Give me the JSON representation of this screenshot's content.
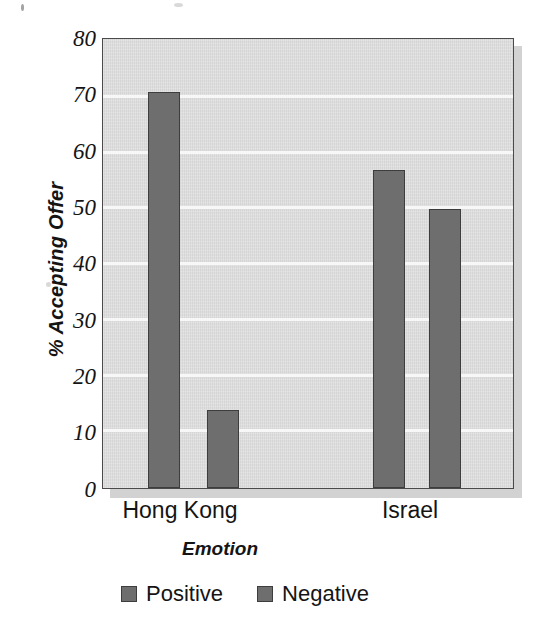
{
  "chart_data": {
    "type": "bar",
    "title": "",
    "xlabel": "Emotion",
    "ylabel": "% Accepting Offer",
    "categories": [
      "Hong Kong",
      "Israel"
    ],
    "series": [
      {
        "name": "Positive",
        "values": [
          71,
          57
        ]
      },
      {
        "name": "Negative",
        "values": [
          14,
          50
        ]
      }
    ],
    "ylim": [
      0,
      80
    ],
    "yticks": [
      80,
      70,
      60,
      50,
      40,
      30,
      20,
      10,
      0
    ],
    "ytick_labels": [
      "80",
      "70",
      "60",
      "50",
      "40",
      "30",
      "20",
      "10",
      "0"
    ],
    "grid": "horizontal",
    "legend_position": "bottom-center",
    "colors": {
      "positive_bar": "#6e6e6e",
      "negative_bar": "#6e6e6e",
      "bar_outline": "#3d3d3d",
      "plot_background": "#dcdcdc",
      "gridline": "#f7f7f7",
      "axis": "#4a4a4a",
      "text": "#141414",
      "page_background": "#ffffff"
    }
  },
  "axes": {
    "y_title": "% Accepting Offer",
    "x_title": "Emotion",
    "y_tick_0": "80",
    "y_tick_1": "70",
    "y_tick_2": "60",
    "y_tick_3": "50",
    "y_tick_4": "40",
    "y_tick_5": "30",
    "y_tick_6": "20",
    "y_tick_7": "10",
    "y_tick_8": "0",
    "x_tick_0": "Hong Kong",
    "x_tick_1": "Israel"
  },
  "legend": {
    "items": [
      {
        "label": "Positive",
        "color": "#6e6e6e"
      },
      {
        "label": "Negative",
        "color": "#6e6e6e"
      }
    ],
    "item_0_label": "Positive",
    "item_1_label": "Negative"
  }
}
